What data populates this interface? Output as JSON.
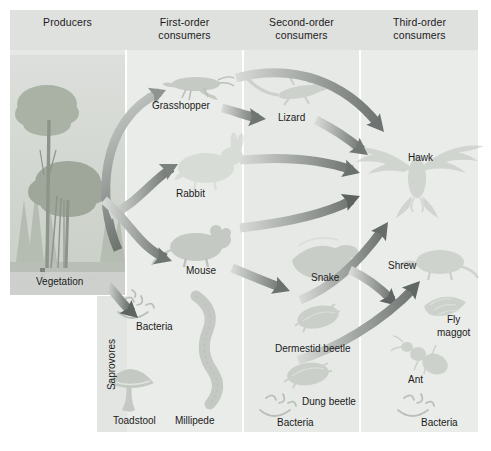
{
  "diagram": {
    "columns": [
      {
        "id": "producers",
        "label": "Producers"
      },
      {
        "id": "first-order",
        "label": "First-order\nconsumers"
      },
      {
        "id": "second-order",
        "label": "Second-order\nconsumers"
      },
      {
        "id": "third-order",
        "label": "Third-order\nconsumers"
      }
    ],
    "side_label": "Saprovores",
    "organisms": [
      {
        "id": "vegetation",
        "label": "Vegetation",
        "column": "producers",
        "x": 36,
        "y": 283,
        "icon": "tree-icon"
      },
      {
        "id": "grasshopper",
        "label": "Grasshopper",
        "column": "first-order",
        "x": 152,
        "y": 106,
        "icon": "grasshopper-icon"
      },
      {
        "id": "rabbit",
        "label": "Rabbit",
        "column": "first-order",
        "x": 176,
        "y": 194,
        "icon": "rabbit-icon"
      },
      {
        "id": "mouse",
        "label": "Mouse",
        "column": "first-order",
        "x": 186,
        "y": 271,
        "icon": "mouse-icon"
      },
      {
        "id": "bacteria-1",
        "label": "Bacteria",
        "column": "first-order",
        "x": 136,
        "y": 327,
        "icon": "bacteria-icon"
      },
      {
        "id": "toadstool",
        "label": "Toadstool",
        "column": "first-order",
        "x": 131,
        "y": 421,
        "icon": "toadstool-icon"
      },
      {
        "id": "millipede",
        "label": "Millipede",
        "column": "first-order",
        "x": 193,
        "y": 421,
        "icon": "millipede-icon"
      },
      {
        "id": "lizard",
        "label": "Lizard",
        "column": "second-order",
        "x": 289,
        "y": 118,
        "icon": "lizard-icon"
      },
      {
        "id": "snake",
        "label": "Snake",
        "column": "second-order",
        "x": 321,
        "y": 278,
        "icon": "snake-icon"
      },
      {
        "id": "dermestid-beetle",
        "label": "Dermestid beetle",
        "column": "second-order",
        "x": 313,
        "y": 349,
        "icon": "beetle-icon"
      },
      {
        "id": "dung-beetle",
        "label": "Dung beetle",
        "column": "second-order",
        "x": 330,
        "y": 402,
        "icon": "beetle-icon"
      },
      {
        "id": "bacteria-2",
        "label": "Bacteria",
        "column": "second-order",
        "x": 301,
        "y": 423,
        "icon": "bacteria-icon"
      },
      {
        "id": "hawk",
        "label": "Hawk",
        "column": "third-order",
        "x": 422,
        "y": 158,
        "icon": "hawk-icon"
      },
      {
        "id": "shrew",
        "label": "Shrew",
        "column": "third-order",
        "x": 403,
        "y": 266,
        "icon": "shrew-icon"
      },
      {
        "id": "fly-maggot",
        "label": "Fly\nmaggot",
        "column": "third-order",
        "x": 447,
        "y": 322,
        "icon": "maggot-icon"
      },
      {
        "id": "ant",
        "label": "Ant",
        "column": "third-order",
        "x": 419,
        "y": 380,
        "icon": "ant-icon"
      },
      {
        "id": "bacteria-3",
        "label": "Bacteria",
        "column": "third-order",
        "x": 441,
        "y": 423,
        "icon": "bacteria-icon"
      }
    ],
    "links": [
      {
        "from": "vegetation",
        "to": "grasshopper"
      },
      {
        "from": "vegetation",
        "to": "rabbit"
      },
      {
        "from": "vegetation",
        "to": "mouse"
      },
      {
        "from": "vegetation",
        "to": "bacteria-1"
      },
      {
        "from": "grasshopper",
        "to": "lizard"
      },
      {
        "from": "grasshopper",
        "to": "hawk"
      },
      {
        "from": "rabbit",
        "to": "hawk"
      },
      {
        "from": "mouse",
        "to": "hawk"
      },
      {
        "from": "mouse",
        "to": "snake"
      },
      {
        "from": "lizard",
        "to": "hawk"
      },
      {
        "from": "snake",
        "to": "hawk"
      },
      {
        "from": "snake",
        "to": "shrew"
      },
      {
        "from": "dung-beetle",
        "to": "shrew"
      }
    ],
    "colors": {
      "header_band": "#dfe1df",
      "column_band": "#e9ebe9",
      "vegetation_label_band": "#cfd1cf",
      "saprovore_band": "#e3e5e3",
      "arrow_dark": "#6e7370",
      "arrow_light": "#c9cdc9",
      "text": "#1b1b1b",
      "silhouette": "#c3c8c2",
      "page_background": "#ffffff"
    }
  }
}
